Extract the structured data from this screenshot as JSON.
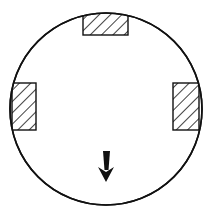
{
  "diagram": {
    "type": "circular-disc-with-hatched-blocks",
    "circle": {
      "cx": 106,
      "cy": 109,
      "r": 96,
      "stroke": "#111111"
    },
    "blocks": [
      {
        "name": "top-block",
        "x": 83,
        "y": 11,
        "w": 45,
        "h": 24
      },
      {
        "name": "left-block",
        "x": 12,
        "y": 83,
        "w": 24,
        "h": 47
      },
      {
        "name": "right-block",
        "x": 173,
        "y": 83,
        "w": 26,
        "h": 47
      }
    ],
    "arrow": {
      "direction": "down",
      "x": 106,
      "y1": 150,
      "y2": 182
    },
    "colors": {
      "line": "#111111",
      "background": "#ffffff"
    }
  }
}
